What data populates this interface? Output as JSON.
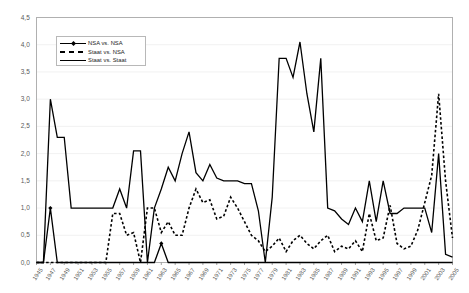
{
  "chart_data": {
    "type": "line",
    "title": "",
    "subtitle": "",
    "xlabel": "",
    "ylabel": "",
    "xlim": [
      1945,
      2005
    ],
    "ylim": [
      0.0,
      4.5
    ],
    "grid": true,
    "legend_position": "top-left-inside",
    "ytick_labels": [
      "0,0",
      "0,5",
      "1,0",
      "1,5",
      "2,0",
      "2,5",
      "3,0",
      "3,5",
      "4,0",
      "4,5"
    ],
    "ytick_values": [
      0.0,
      0.5,
      1.0,
      1.5,
      2.0,
      2.5,
      3.0,
      3.5,
      4.0,
      4.5
    ],
    "xtick_labels": [
      "1945",
      "1947",
      "1949",
      "1951",
      "1953",
      "1955",
      "1957",
      "1959",
      "1961",
      "1963",
      "1965",
      "1967",
      "1969",
      "1971",
      "1973",
      "1975",
      "1977",
      "1979",
      "1981",
      "1983",
      "1985",
      "1987",
      "1989",
      "1991",
      "1993",
      "1995",
      "1997",
      "1999",
      "2001",
      "2003",
      "2005"
    ],
    "xtick_values": [
      1945,
      1947,
      1949,
      1951,
      1953,
      1955,
      1957,
      1959,
      1961,
      1963,
      1965,
      1967,
      1969,
      1971,
      1973,
      1975,
      1977,
      1979,
      1981,
      1983,
      1985,
      1987,
      1989,
      1991,
      1993,
      1995,
      1997,
      1999,
      2001,
      2003,
      2005
    ],
    "x": [
      1945,
      1946,
      1947,
      1948,
      1949,
      1950,
      1951,
      1952,
      1953,
      1954,
      1955,
      1956,
      1957,
      1958,
      1959,
      1960,
      1961,
      1962,
      1963,
      1964,
      1965,
      1966,
      1967,
      1968,
      1969,
      1970,
      1971,
      1972,
      1973,
      1974,
      1975,
      1976,
      1977,
      1978,
      1979,
      1980,
      1981,
      1982,
      1983,
      1984,
      1985,
      1986,
      1987,
      1988,
      1989,
      1990,
      1991,
      1992,
      1993,
      1994,
      1995,
      1996,
      1997,
      1998,
      1999,
      2000,
      2001,
      2002,
      2003,
      2004,
      2005
    ],
    "series": [
      {
        "name": "NSA vs. NSA",
        "style": "solid-with-markers",
        "color": "#000000",
        "values": [
          0,
          0,
          1.0,
          0,
          0,
          0,
          0,
          0,
          0,
          0,
          0,
          0,
          0,
          0,
          0,
          0,
          0,
          0,
          0.35,
          0,
          0,
          0,
          0,
          0,
          0,
          0,
          0,
          0,
          0,
          0,
          0,
          0,
          0,
          0,
          0,
          0,
          0,
          0,
          0,
          0,
          0,
          0,
          0,
          0,
          0,
          0,
          0,
          0,
          0,
          0,
          0,
          0,
          0,
          0,
          0,
          0,
          0,
          0,
          0,
          0,
          0
        ]
      },
      {
        "name": "Staat vs. NSA",
        "style": "dashed",
        "color": "#000000",
        "values": [
          0,
          0,
          0,
          0,
          0,
          0,
          0,
          0,
          0,
          0,
          0,
          0.9,
          0.9,
          0.5,
          0.55,
          0,
          1.0,
          1.0,
          0.55,
          0.75,
          0.5,
          0.5,
          1.0,
          1.35,
          1.1,
          1.15,
          0.8,
          0.85,
          1.2,
          1.0,
          0.75,
          0.5,
          0.4,
          0.2,
          0.3,
          0.45,
          0.2,
          0.4,
          0.5,
          0.35,
          0.25,
          0.4,
          0.5,
          0.2,
          0.3,
          0.25,
          0.4,
          0.2,
          0.9,
          0.4,
          0.45,
          1.05,
          0.35,
          0.25,
          0.3,
          0.6,
          1.1,
          1.6,
          3.1,
          1.5,
          0.45
        ]
      },
      {
        "name": "Staat vs. Staat",
        "style": "solid",
        "color": "#000000",
        "values": [
          0,
          0,
          3.0,
          2.3,
          2.3,
          1.0,
          1.0,
          1.0,
          1.0,
          1.0,
          1.0,
          1.0,
          1.35,
          1.0,
          2.05,
          2.05,
          0,
          1.0,
          1.35,
          1.75,
          1.5,
          2.0,
          2.4,
          1.65,
          1.5,
          1.8,
          1.55,
          1.5,
          1.5,
          1.5,
          1.45,
          1.45,
          0.95,
          0,
          1.2,
          3.75,
          3.75,
          3.4,
          4.05,
          3.1,
          2.4,
          3.75,
          1.0,
          0.95,
          0.8,
          0.7,
          1.0,
          0.75,
          1.5,
          0.75,
          1.5,
          0.9,
          0.9,
          1.0,
          1.0,
          1.0,
          1.0,
          0.55,
          2.0,
          0.15,
          0.1
        ]
      }
    ]
  },
  "legend": {
    "items": [
      {
        "label": "NSA vs. NSA",
        "key": "solid-marker"
      },
      {
        "label": "Staat vs. NSA",
        "key": "dashed"
      },
      {
        "label": "Staat vs. Staat",
        "key": "solid"
      }
    ]
  }
}
